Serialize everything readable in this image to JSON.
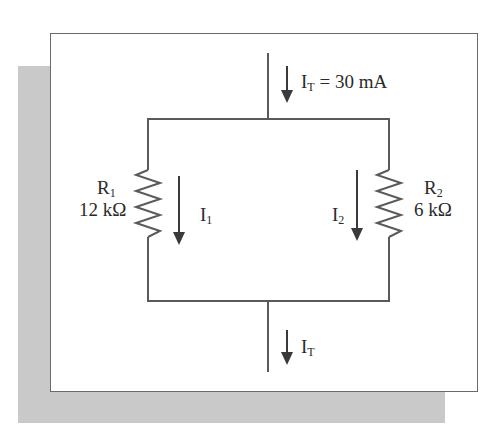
{
  "diagram": {
    "type": "parallel-circuit",
    "colors": {
      "wire": "#5a5a5a",
      "arrow": "#3a3a3a",
      "shadow": "#c9c9c9",
      "frame": "#6a6a6a"
    },
    "total_current_top": {
      "symbol": "I",
      "subscript": "T",
      "equals": " = 30 mA"
    },
    "total_current_bottom": {
      "symbol": "I",
      "subscript": "T"
    },
    "resistor_1": {
      "symbol": "R",
      "subscript": "1",
      "value": "12 kΩ"
    },
    "resistor_2": {
      "symbol": "R",
      "subscript": "2",
      "value": "6 kΩ"
    },
    "current_1": {
      "symbol": "I",
      "subscript": "1"
    },
    "current_2": {
      "symbol": "I",
      "subscript": "2"
    }
  }
}
